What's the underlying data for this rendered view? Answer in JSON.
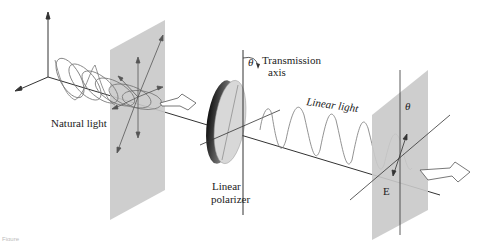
{
  "diagram": {
    "labels": {
      "natural_light": "Natural light",
      "transmission_axis_line1": "Transmission",
      "transmission_axis_line2": "axis",
      "theta_polarizer": "θ",
      "linear_light": "Linear light",
      "linear_polarizer_line1": "Linear",
      "linear_polarizer_line2": "polarizer",
      "theta_panel": "θ",
      "e_field": "E"
    },
    "caption": "Figure",
    "colors": {
      "panel": "#c9c9c9",
      "line": "#333333",
      "wave": "#777777",
      "polarizer_light": "#d8d8d8",
      "polarizer_dark": "#2a2a2a"
    }
  }
}
